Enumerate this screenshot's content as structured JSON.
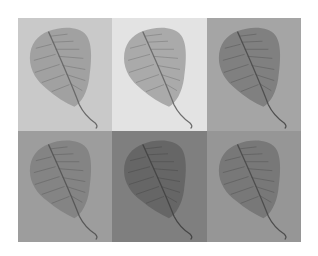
{
  "figure": {
    "rows": 2,
    "columns": 3,
    "panels": [
      {
        "position": "top-left",
        "background": "#c9c9c9",
        "leaf": "#9f9f9f",
        "vein": "#6a6a6a"
      },
      {
        "position": "top-center",
        "background": "#e3e3e3",
        "leaf": "#a6a6a6",
        "vein": "#6e6e6e"
      },
      {
        "position": "top-right",
        "background": "#a5a5a5",
        "leaf": "#7d7d7d",
        "vein": "#505050"
      },
      {
        "position": "bottom-left",
        "background": "#9d9d9d",
        "leaf": "#838383",
        "vein": "#585858"
      },
      {
        "position": "bottom-center",
        "background": "#7f7f7f",
        "leaf": "#656565",
        "vein": "#464646"
      },
      {
        "position": "bottom-right",
        "background": "#969696",
        "leaf": "#767676",
        "vein": "#4e4e4e"
      }
    ]
  }
}
